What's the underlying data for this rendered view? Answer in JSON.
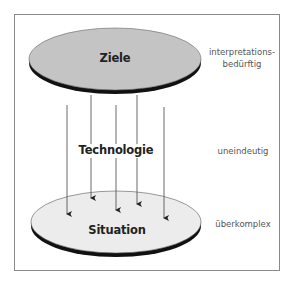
{
  "diagram": {
    "top_disc": {
      "label": "Ziele",
      "fill": "#c4c4c4",
      "rim": "#111111"
    },
    "middle": {
      "label": "Technologie"
    },
    "bottom_disc": {
      "label": "Situation",
      "fill": "#ececec",
      "rim": "#111111"
    },
    "annotations": {
      "top_line1": "interpretations-",
      "top_line2": "bedürftig",
      "middle": "uneindeutig",
      "bottom": "überkomplex"
    },
    "arrows": [
      {
        "x": 67,
        "y1": 105,
        "y2": 214
      },
      {
        "x": 91,
        "y1": 95,
        "y2": 198
      },
      {
        "x": 116,
        "y1": 105,
        "y2": 210
      },
      {
        "x": 137,
        "y1": 95,
        "y2": 204
      },
      {
        "x": 164,
        "y1": 107,
        "y2": 218
      }
    ],
    "frame_color": "#8a8a8a"
  }
}
